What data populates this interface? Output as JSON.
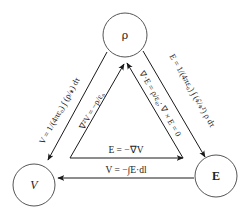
{
  "diagram": {
    "title": "",
    "nodes": [
      {
        "id": "rho",
        "label": "ρ",
        "cx": 125,
        "cy": 35,
        "r": 22
      },
      {
        "id": "V",
        "label": "V",
        "cx": 34,
        "cy": 185,
        "r": 21
      },
      {
        "id": "E",
        "label": "E",
        "cx": 216,
        "cy": 176,
        "r": 21
      }
    ],
    "edges": {
      "rho_to_V": {
        "from": "ρ",
        "to": "V",
        "label": "V = 1/(4πε₀) ∫ (ρ/𝓻) dτ"
      },
      "rho_to_E": {
        "from": "ρ",
        "to": "E",
        "label": "E = 1/(4πε₀) ∫ (𝓻̂/𝓻²) ρ dτ"
      },
      "E_to_V": {
        "from": "E",
        "to": "V",
        "label": "V = −∫E·dl"
      },
      "V_to_E": {
        "from": "V",
        "to": "E",
        "label": "E = −∇V"
      },
      "V_to_rho": {
        "from": "V",
        "to": "ρ",
        "label": "∇²V = −ρ/ε₀"
      },
      "E_to_rho": {
        "from": "E",
        "to": "ρ",
        "label": "∇·E = ρ/ε₀; ∇ × E = 0"
      }
    }
  },
  "labels": {
    "rho_node": "ρ",
    "V_node": "V",
    "E_node": "E",
    "left_outer": "V = 1/(4πε₀) ∫ (ρ/𝓻) dτ",
    "left_inner": "∇²V = −ρ/ε₀",
    "right_outer": "E = 1/(4πε₀) ∫ (𝓻̂/𝓻²) ρ dτ",
    "right_inner": "∇·E = ρ/ε₀; ∇ × E = 0",
    "bottom_inner": "E = −∇V",
    "bottom_outer": "V = −∫E·dl"
  }
}
